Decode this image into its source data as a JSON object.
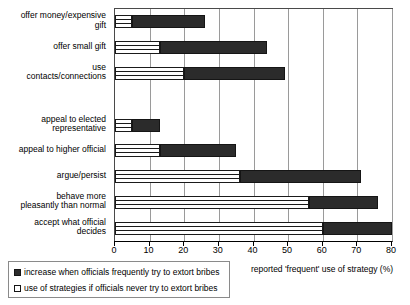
{
  "chart_data": {
    "type": "bar",
    "orientation": "horizontal",
    "stacked": true,
    "title": "",
    "xlabel": "reported 'frequent' use of strategy (%)",
    "ylabel": "",
    "xlim": [
      0,
      80
    ],
    "xticks": [
      0,
      10,
      20,
      30,
      40,
      50,
      60,
      70,
      80
    ],
    "grid": true,
    "legend_position": "bottom-left",
    "categories": [
      "offer money/expensive gift",
      "offer small gift",
      "use contacts/connections",
      "",
      "appeal to elected representative",
      "appeal to higher official",
      "argue/persist",
      "behave more pleasantly than normal",
      "accept what official decides"
    ],
    "series": [
      {
        "name": "use of strategies if officials never try to extort bribes",
        "color": "#ffffff",
        "values": [
          5,
          13,
          20,
          null,
          5,
          13,
          36,
          56,
          60
        ]
      },
      {
        "name": "increase when officials frequently try to extort bribes",
        "color": "#2b2b2b",
        "values": [
          21,
          31,
          29,
          null,
          8,
          22,
          35,
          20,
          20
        ]
      }
    ],
    "cumulative_totals": [
      26,
      44,
      49,
      null,
      13,
      35,
      71,
      76,
      80
    ]
  },
  "legend": {
    "items": [
      {
        "label": "increase when officials frequently try to extort bribes",
        "swatch": "dark"
      },
      {
        "label": "use of strategies if officials never try to extort bribes",
        "swatch": "light"
      }
    ]
  },
  "axis": {
    "x_title": "reported 'frequent' use of strategy (%)",
    "tick_labels": [
      "0",
      "10",
      "20",
      "30",
      "40",
      "50",
      "60",
      "70",
      "80"
    ]
  },
  "categories_display": [
    {
      "lines": [
        "offer money/expensive",
        "gift"
      ]
    },
    {
      "lines": [
        "offer small gift"
      ]
    },
    {
      "lines": [
        "use",
        "contacts/connections"
      ]
    },
    {
      "lines": []
    },
    {
      "lines": [
        "appeal to elected",
        "representative"
      ]
    },
    {
      "lines": [
        "appeal to higher official"
      ]
    },
    {
      "lines": [
        "argue/persist"
      ]
    },
    {
      "lines": [
        "behave more",
        "pleasantly than normal"
      ]
    },
    {
      "lines": [
        "accept what official",
        "decides"
      ]
    }
  ]
}
